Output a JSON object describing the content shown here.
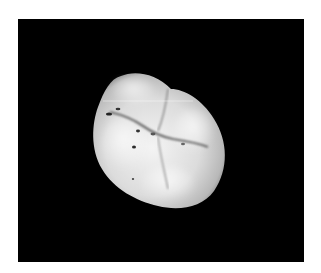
{
  "image": {
    "subject": "molar tooth occlusal view",
    "alt": "Photograph of a molar tooth crown viewed from the occlusal surface on a black background",
    "background_color": "#000000",
    "border_color": "#ffffff",
    "tooth_color": "#e6e6e6"
  }
}
